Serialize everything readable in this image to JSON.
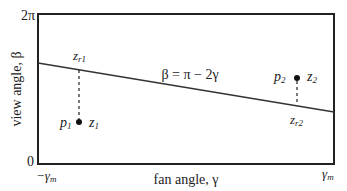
{
  "diagram": {
    "y_axis": {
      "label": "view angle, β",
      "top_tick": "2π",
      "bottom_tick": "0"
    },
    "x_axis": {
      "label": "fan angle, γ",
      "left_tick": "−γ",
      "left_tick_sub": "m",
      "right_tick": "γ",
      "right_tick_sub": "m"
    },
    "line_label": "β = π − 2γ",
    "points": [
      {
        "p": "p",
        "p_sub": "1",
        "z": "z",
        "z_sub": "1",
        "zr": "z",
        "zr_sub": "r1"
      },
      {
        "p": "p",
        "p_sub": "2",
        "z": "z",
        "z_sub": "2",
        "zr": "z",
        "zr_sub": "r2"
      }
    ]
  }
}
